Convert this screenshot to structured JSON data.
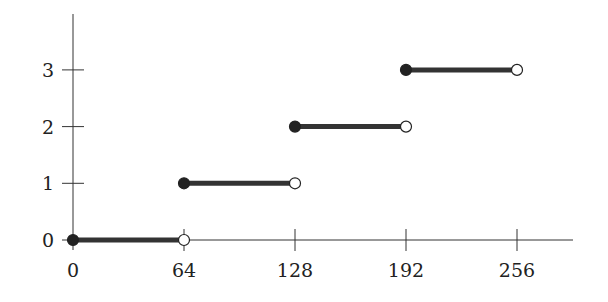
{
  "chart_data": {
    "type": "line",
    "subtype": "step-function",
    "title": "",
    "xlabel": "",
    "ylabel": "",
    "xlim": [
      0,
      300
    ],
    "ylim": [
      0,
      3.8
    ],
    "grid": false,
    "legend": null,
    "x_ticks": [
      0,
      64,
      128,
      192,
      256
    ],
    "x_tick_labels": [
      "0",
      "64",
      "128",
      "192",
      "256"
    ],
    "y_ticks": [
      0,
      1,
      2,
      3
    ],
    "y_tick_labels": [
      "0",
      "1",
      "2",
      "3"
    ],
    "segments": [
      {
        "x_start": 0,
        "x_end": 64,
        "y": 0,
        "start": "closed",
        "end": "open"
      },
      {
        "x_start": 64,
        "x_end": 128,
        "y": 1,
        "start": "closed",
        "end": "open"
      },
      {
        "x_start": 128,
        "x_end": 192,
        "y": 2,
        "start": "closed",
        "end": "open"
      },
      {
        "x_start": 192,
        "x_end": 256,
        "y": 3,
        "start": "closed",
        "end": "open"
      }
    ],
    "colors": {
      "segment": "#333333",
      "axis": "#333333",
      "closed_marker": "#222222",
      "open_marker_fill": "#ffffff"
    }
  }
}
